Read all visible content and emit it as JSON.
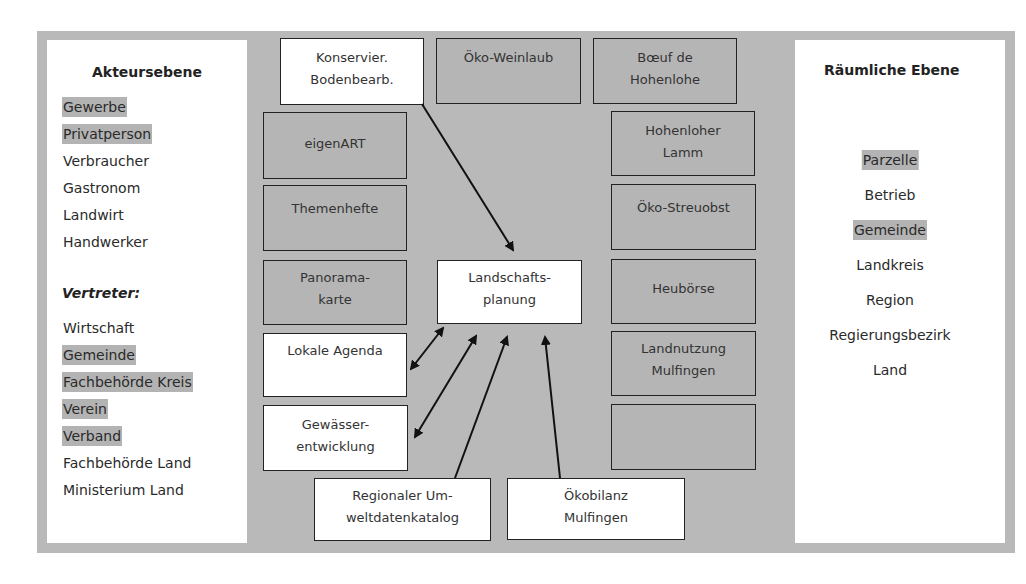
{
  "left_panel": {
    "title": "Akteursebene",
    "actors": [
      {
        "label": "Gewerbe",
        "highlighted": true
      },
      {
        "label": "Privatperson",
        "highlighted": true
      },
      {
        "label": "Verbraucher",
        "highlighted": false
      },
      {
        "label": "Gastronom",
        "highlighted": false
      },
      {
        "label": "Landwirt",
        "highlighted": false
      },
      {
        "label": "Handwerker",
        "highlighted": false
      }
    ],
    "representatives_title": "Vertreter:",
    "representatives": [
      {
        "label": "Wirtschaft",
        "highlighted": false
      },
      {
        "label": "Gemeinde",
        "highlighted": true
      },
      {
        "label": "Fachbehörde Kreis",
        "highlighted": true
      },
      {
        "label": "Verein",
        "highlighted": true
      },
      {
        "label": "Verband",
        "highlighted": true
      },
      {
        "label": "Fachbehörde Land",
        "highlighted": false
      },
      {
        "label": "Ministerium Land",
        "highlighted": false
      }
    ]
  },
  "right_panel": {
    "title": "Räumliche Ebene",
    "levels": [
      {
        "label": "Parzelle",
        "highlighted": true
      },
      {
        "label": "Betrieb",
        "highlighted": false
      },
      {
        "label": "Gemeinde",
        "highlighted": true
      },
      {
        "label": "Landkreis",
        "highlighted": false
      },
      {
        "label": "Region",
        "highlighted": false
      },
      {
        "label": "Regierungsbezirk",
        "highlighted": false
      },
      {
        "label": "Land",
        "highlighted": false
      }
    ]
  },
  "projects": {
    "konservier": {
      "label": "Konservier.\nBodenbearb.",
      "style": "white"
    },
    "oeko_weinlaub": {
      "label": "Öko-Weinlaub",
      "style": "grey"
    },
    "boeuf": {
      "label": "Bœuf de\nHohenlohe",
      "style": "grey"
    },
    "eigenart": {
      "label": "eigenART",
      "style": "grey"
    },
    "hohenloher_lamm": {
      "label": "Hohenloher\nLamm",
      "style": "grey"
    },
    "themenhefte": {
      "label": "Themenhefte",
      "style": "grey"
    },
    "oeko_streuobst": {
      "label": "Öko-Streuobst",
      "style": "grey"
    },
    "panoramakarte": {
      "label": "Panorama-\nkarte",
      "style": "grey"
    },
    "landschaftsplanung": {
      "label": "Landschafts-\nplanung",
      "style": "white"
    },
    "heuboerse": {
      "label": "Heubörse",
      "style": "grey"
    },
    "lokale_agenda": {
      "label": "Lokale Agenda",
      "style": "white"
    },
    "landnutzung": {
      "label": "Landnutzung\nMulfingen",
      "style": "grey"
    },
    "gewaesser": {
      "label": "Gewässer-\nentwicklung",
      "style": "white"
    },
    "empty_box": {
      "label": "",
      "style": "grey"
    },
    "umweltdatenkatalog": {
      "label": "Regionaler Um-\nweltdatenkatalog",
      "style": "white"
    },
    "oekobilanz": {
      "label": "Ökobilanz\nMulfingen",
      "style": "white"
    }
  },
  "connections": [
    {
      "from": "Konservier. Bodenbearb.",
      "to": "Landschaftsplanung",
      "direction": "one-way"
    },
    {
      "from": "Lokale Agenda",
      "to": "Landschaftsplanung",
      "direction": "two-way"
    },
    {
      "from": "Gewässerentwicklung",
      "to": "Landschaftsplanung",
      "direction": "two-way"
    },
    {
      "from": "Regionaler Umweltdatenkatalog",
      "to": "Landschaftsplanung",
      "direction": "one-way"
    },
    {
      "from": "Ökobilanz Mulfingen",
      "to": "Landschaftsplanung",
      "direction": "one-way"
    }
  ],
  "colors": {
    "frame": "#b9b9b9",
    "grey_box": "#b5b5b5",
    "highlight": "#b3b3b3",
    "white_box": "#ffffff",
    "line": "#111111"
  }
}
